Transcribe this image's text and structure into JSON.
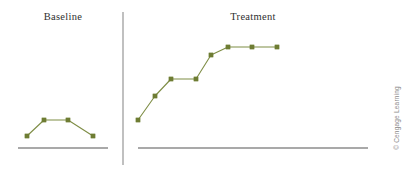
{
  "figure": {
    "width": 404,
    "height": 172,
    "background_color": "#ffffff",
    "credit_line": "© Cengage Learning",
    "credit_color": "#8a8a8a",
    "divider_color": "#8c8c8c",
    "axis_color": "#8c8c8c",
    "label_color": "#2f2f2f"
  },
  "panels": {
    "baseline": {
      "label": "Baseline"
    },
    "treatment": {
      "label": "Treatment"
    }
  },
  "chart_data": {
    "type": "line",
    "title": "",
    "subtitle": "",
    "xlabel": "",
    "ylabel": "",
    "grid": false,
    "legend": "none",
    "marker": "square",
    "marker_color": "#6e7d33",
    "line_color": "#7e8d45",
    "annotations": [
      "Baseline",
      "Treatment",
      "© Cengage Learning"
    ],
    "phase_divider_x": 123,
    "xlim": [
      0,
      20
    ],
    "ylim": [
      0,
      10
    ],
    "series": [
      {
        "name": "Baseline",
        "phase": "baseline",
        "x": [
          1,
          2,
          3,
          4
        ],
        "values": [
          1.2,
          2.8,
          2.8,
          1.2
        ],
        "pixels": [
          {
            "x": 27,
            "y": 136
          },
          {
            "x": 44,
            "y": 120
          },
          {
            "x": 68,
            "y": 120
          },
          {
            "x": 93,
            "y": 136
          }
        ],
        "axis": {
          "x1": 18,
          "x2": 108,
          "y": 148
        }
      },
      {
        "name": "Treatment",
        "phase": "treatment",
        "x": [
          5,
          6,
          7,
          8,
          9,
          10,
          11,
          12
        ],
        "values": [
          2.8,
          4.5,
          6.0,
          6.0,
          7.6,
          8.4,
          8.4,
          8.4
        ],
        "pixels": [
          {
            "x": 138,
            "y": 120
          },
          {
            "x": 155,
            "y": 96
          },
          {
            "x": 171,
            "y": 79
          },
          {
            "x": 196,
            "y": 79
          },
          {
            "x": 211,
            "y": 55
          },
          {
            "x": 228,
            "y": 47
          },
          {
            "x": 252,
            "y": 47
          },
          {
            "x": 277,
            "y": 47
          }
        ],
        "axis": {
          "x1": 138,
          "x2": 368,
          "y": 148
        }
      }
    ]
  }
}
